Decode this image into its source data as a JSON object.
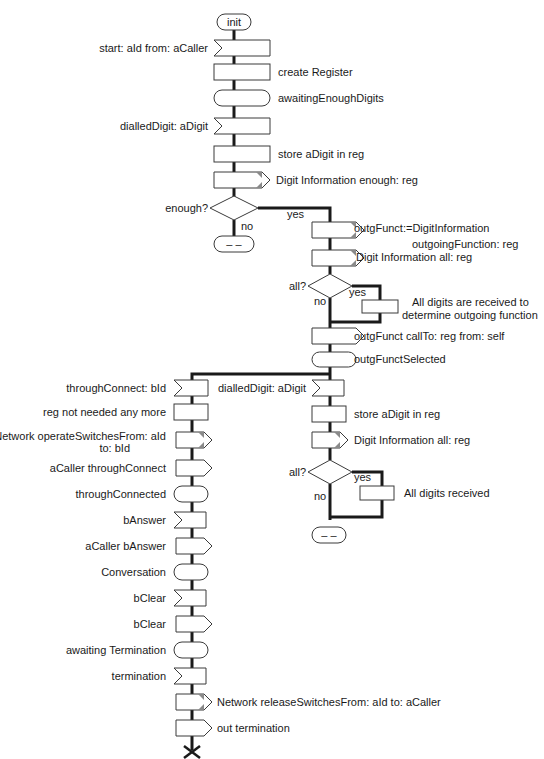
{
  "diagram": {
    "type": "SDL process flowchart",
    "start": {
      "label": "init"
    },
    "main_column": [
      {
        "kind": "input",
        "label": "start: aId from: aCaller"
      },
      {
        "kind": "task",
        "label": "create Register"
      },
      {
        "kind": "state",
        "label": "awaitingEnoughDigits"
      },
      {
        "kind": "input",
        "label": "dialledDigit: aDigit"
      },
      {
        "kind": "task",
        "label": "store aDigit in reg"
      },
      {
        "kind": "output",
        "label": "Digit Information enough: reg"
      },
      {
        "kind": "decision",
        "label": "enough?",
        "yes": "yes",
        "no": "no"
      },
      {
        "kind": "state",
        "label": "– –"
      }
    ],
    "yes_branch_1": [
      {
        "kind": "output",
        "label_line1": "outgFunct:=DigitInformation",
        "label_line2": "outgoingFunction: reg"
      },
      {
        "kind": "output",
        "label": "Digit Information all: reg"
      },
      {
        "kind": "decision",
        "label": "all?",
        "yes": "yes",
        "no": "no"
      },
      {
        "kind": "task",
        "label_line1": "All digits are received to",
        "label_line2": "determine outgoing function"
      },
      {
        "kind": "output",
        "label": "outgFunct callTo: reg from: self"
      },
      {
        "kind": "state",
        "label": "outgFunctSelected"
      }
    ],
    "left_branch": [
      {
        "kind": "input",
        "label": "throughConnect: bId"
      },
      {
        "kind": "task",
        "label": "reg not needed any more"
      },
      {
        "kind": "output",
        "label_line1": "Network operateSwitchesFrom: aId",
        "label_line2": "to: bId"
      },
      {
        "kind": "output",
        "label": "aCaller throughConnect"
      },
      {
        "kind": "state",
        "label": "throughConnected"
      },
      {
        "kind": "input",
        "label": "bAnswer"
      },
      {
        "kind": "output",
        "label": "aCaller bAnswer"
      },
      {
        "kind": "state",
        "label": "Conversation"
      },
      {
        "kind": "input",
        "label": "bClear"
      },
      {
        "kind": "output",
        "label": "bClear"
      },
      {
        "kind": "state",
        "label": "awaiting Termination"
      },
      {
        "kind": "input",
        "label": "termination"
      },
      {
        "kind": "output",
        "label": "Network releaseSwitchesFrom: aId to: aCaller"
      },
      {
        "kind": "output",
        "label": "out termination"
      },
      {
        "kind": "stop",
        "label": "stop"
      }
    ],
    "right_branch": [
      {
        "kind": "input",
        "label": "dialledDigit: aDigit"
      },
      {
        "kind": "task",
        "label": "store aDigit in reg"
      },
      {
        "kind": "output",
        "label": "Digit Information all: reg"
      },
      {
        "kind": "decision",
        "label": "all?",
        "yes": "yes",
        "no": "no"
      },
      {
        "kind": "task",
        "label": "All digits received"
      },
      {
        "kind": "state",
        "label": "– –"
      }
    ],
    "colors": {
      "line": "#1a1a1a",
      "symbol_border": "#3a3a3a",
      "tick": "#8a8a8a",
      "background": "#ffffff"
    }
  }
}
